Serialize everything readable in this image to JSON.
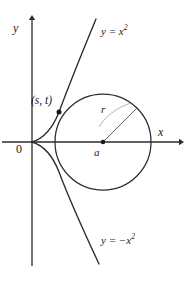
{
  "figure": {
    "width": 188,
    "height": 284,
    "background_color": "#ffffff",
    "stroke_color": "#2b2b2b",
    "text_color": "#1a1a1a"
  },
  "axes": {
    "x_label": "x",
    "y_label": "y",
    "origin_label": "0",
    "origin_px": {
      "x": 32,
      "y": 142
    },
    "x_axis_from_px": {
      "x": 2,
      "y": 142
    },
    "x_axis_to_px": {
      "x": 181,
      "y": 142
    },
    "y_axis_from_px": {
      "x": 32,
      "y": 16
    },
    "y_axis_to_px": {
      "x": 32,
      "y": 266
    },
    "arrowheads": [
      "x-positive",
      "y-positive"
    ]
  },
  "curves": [
    {
      "name": "upper-parabola",
      "label_text": "y = x",
      "label_exponent": "2",
      "equation": "y = x^2",
      "orientation": "opens-right-upper-branch"
    },
    {
      "name": "lower-parabola",
      "label_text": "y = −x",
      "label_exponent": "2",
      "equation": "y = -x^2",
      "orientation": "opens-right-lower-branch"
    }
  ],
  "circle": {
    "name": "tangent-circle",
    "center_px": {
      "x": 103,
      "y": 142
    },
    "radius_px": 48,
    "center_label": "a",
    "radius_label": "r",
    "radius_line_to_px": {
      "x": 137,
      "y": 108
    },
    "arc_annotation": true
  },
  "points": [
    {
      "name": "tangency-point",
      "label": "(s, t)",
      "label_parts": {
        "open": "(",
        "first": "s",
        "sep": ", ",
        "second": "t",
        "close": ")"
      },
      "marker_px": {
        "x": 59,
        "y": 112
      },
      "marker_style": "filled-dot"
    },
    {
      "name": "circle-center-point",
      "label": "a",
      "marker_px": {
        "x": 103,
        "y": 142
      },
      "marker_style": "filled-dot"
    }
  ]
}
